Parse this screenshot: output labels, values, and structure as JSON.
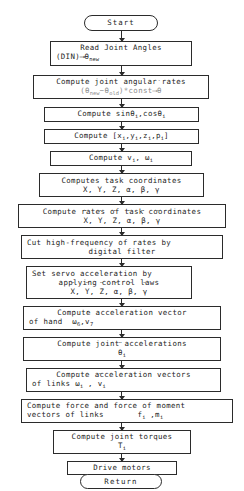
{
  "diagram": {
    "orientation": "top-to-bottom",
    "stroke_color": "#2b2b2b",
    "background_color": "#ffffff"
  },
  "nodes": [
    {
      "id": "start",
      "shape": "terminator",
      "label": "Start"
    },
    {
      "id": "read-joint-angles",
      "shape": "process",
      "line1": "Read Joint Angles",
      "line2_prefix": "(DIN)",
      "line2_arrow": "⟶",
      "line2_symbol": "θ",
      "line2_subscript": "new"
    },
    {
      "id": "joint-angular-rates",
      "shape": "process",
      "line1": "Compute joint angular rates",
      "line2_open": "(",
      "line2_theta1": "θ",
      "line2_sub1": "new",
      "line2_minus": "−",
      "line2_theta2": "θ",
      "line2_sub2": "old",
      "line2_close": ")*const",
      "line2_arrow": "⟶",
      "line2_result": "θ"
    },
    {
      "id": "sin-cos",
      "shape": "process",
      "line1_prefix": "Compute",
      "line1_sin": "sin",
      "line1_theta1": "θ",
      "line1_sub1": "i",
      "line1_comma": ",",
      "line1_cos": "cos",
      "line1_theta2": "θ",
      "line1_sub2": "i"
    },
    {
      "id": "position-vectors",
      "shape": "process",
      "line1_prefix": "Compute",
      "line1_open": "[",
      "line1_x": "x",
      "line1_y": "y",
      "line1_z": "z",
      "line1_p": "p",
      "line1_sub": "i",
      "line1_close": "]"
    },
    {
      "id": "velocities",
      "shape": "process",
      "line1_prefix": "Compute",
      "line1_v": "v",
      "line1_w": "ω",
      "line1_sub": "i"
    },
    {
      "id": "task-coordinates",
      "shape": "process",
      "line1": "Computes task coordinates",
      "line2": "X, Y, Z, α, β, γ"
    },
    {
      "id": "task-coordinate-rates",
      "shape": "process",
      "line1": "Compute rates of task coordinates",
      "line2_symbols": [
        "X",
        "Y",
        "Z",
        "α",
        "β",
        "γ"
      ],
      "line2_accent": "dot"
    },
    {
      "id": "digital-filter",
      "shape": "process",
      "line1": "Cut high-frequency of rates by",
      "line2": "digital filter"
    },
    {
      "id": "servo-acceleration",
      "shape": "process",
      "line1": "Set servo acceleration by",
      "line2": "applying control laws",
      "line3_symbols": [
        "X",
        "Y",
        "Z",
        "α",
        "β",
        "γ"
      ],
      "line3_accent": "double-dot"
    },
    {
      "id": "hand-acceleration",
      "shape": "process",
      "line1": "Compute acceleration vector",
      "line2_prefix": "of hand",
      "line2_omega": "ω",
      "line2_omega_sub": "6",
      "line2_comma": ",",
      "line2_v": "v",
      "line2_v_sub": "7"
    },
    {
      "id": "joint-accelerations",
      "shape": "process",
      "line1": "Compute joint accelerations",
      "line2_symbol": "θ",
      "line2_sub": "i",
      "line2_accent": "double-dot"
    },
    {
      "id": "link-accelerations",
      "shape": "process",
      "line1": "Compute acceleration vectors",
      "line2_prefix": "of links",
      "line2_omega": "ω",
      "line2_comma": ",",
      "line2_v": "v",
      "line2_sub": "i"
    },
    {
      "id": "link-forces",
      "shape": "process",
      "line1": "Compute force and force of moment",
      "line2_prefix": "vectors of links",
      "line2_f": "f",
      "line2_comma": ",",
      "line2_m": "m",
      "line2_sub": "i"
    },
    {
      "id": "joint-torques",
      "shape": "process",
      "line1": "Compute joint torques",
      "line2_symbol": "T",
      "line2_sub": "i"
    },
    {
      "id": "drive-motors",
      "shape": "process",
      "line1": "Drive motors"
    },
    {
      "id": "return",
      "shape": "terminator",
      "label": "Return"
    }
  ]
}
